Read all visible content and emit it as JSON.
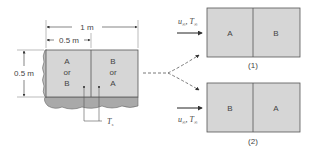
{
  "diagram": {
    "type": "schematic",
    "colors": {
      "plate_fill": "#d6d6d6",
      "plate_side": "#a9a9a9",
      "line": "#555555",
      "text": "#444444"
    },
    "plate": {
      "dimension_total": "1 m",
      "dimension_half": "0.5 m",
      "dimension_height": "0.5 m",
      "left_region": {
        "line1": "A",
        "line2": "or",
        "line3": "B"
      },
      "right_region": {
        "line1": "B",
        "line2": "or",
        "line3": "A"
      },
      "thermocouple_label": "T",
      "thermocouple_subscript": "s"
    },
    "configurations": [
      {
        "caption": "(1)",
        "flow_label": "u",
        "flow_label_sub": "∞",
        "flow_temp": "T",
        "flow_temp_sub": "∞",
        "left": "A",
        "right": "B"
      },
      {
        "caption": "(2)",
        "flow_label": "u",
        "flow_label_sub": "∞",
        "flow_temp": "T",
        "flow_temp_sub": "∞",
        "left": "B",
        "right": "A"
      }
    ]
  }
}
